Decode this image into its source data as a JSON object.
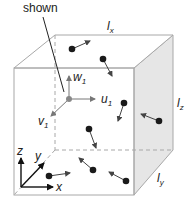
{
  "callout": {
    "text": "shown"
  },
  "dimensions": {
    "lx": {
      "base": "l",
      "sub": "x"
    },
    "ly": {
      "base": "l",
      "sub": "y"
    },
    "lz": {
      "base": "l",
      "sub": "z"
    }
  },
  "velocity_components": {
    "u": {
      "base": "u",
      "sub": "1"
    },
    "v": {
      "base": "v",
      "sub": "1"
    },
    "w": {
      "base": "w",
      "sub": "1"
    }
  },
  "axes": {
    "x": "x",
    "y": "y",
    "z": "z"
  },
  "colors": {
    "edge": "#a8a8a8",
    "shade": "#e4e4e4",
    "particle": "#1a1a1a",
    "arrow": "#444444",
    "origin_particle": "#888888"
  },
  "particles": [
    {
      "x": 72,
      "y": 49,
      "dx": 18,
      "dy": -8
    },
    {
      "x": 103,
      "y": 59,
      "dx": 9,
      "dy": 17
    },
    {
      "x": 124,
      "y": 103,
      "dx": -6,
      "dy": 18
    },
    {
      "x": 159,
      "y": 121,
      "dx": -18,
      "dy": -7
    },
    {
      "x": 89,
      "y": 129,
      "dx": 7,
      "dy": 19
    },
    {
      "x": 93,
      "y": 170,
      "dx": -14,
      "dy": -12
    },
    {
      "x": 126,
      "y": 181,
      "dx": -17,
      "dy": -9
    },
    {
      "x": 49,
      "y": 176,
      "dx": 21,
      "dy": -3
    }
  ]
}
